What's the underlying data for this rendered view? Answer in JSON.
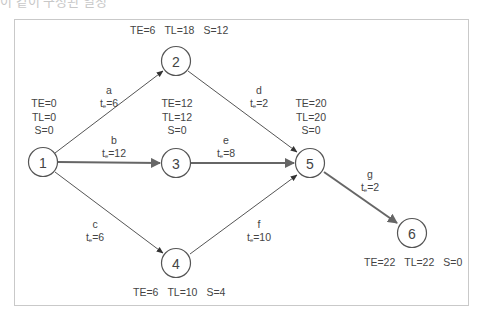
{
  "cutoff_text": "이 같이 구성된 일정",
  "colors": {
    "frame": "#c9c9c9",
    "line": "#555555",
    "critical_arrow": "#666666",
    "text": "#444444"
  },
  "nodes": [
    {
      "id": "1",
      "label": "1",
      "cx": 43,
      "cy": 162,
      "TE": "TE=0",
      "TL": "TL=0",
      "S": "S=0"
    },
    {
      "id": "2",
      "label": "2",
      "cx": 176,
      "cy": 61,
      "TE": "TE=6",
      "TL": "TL=18",
      "S": "S=12"
    },
    {
      "id": "3",
      "label": "3",
      "cx": 176,
      "cy": 163,
      "TE": "TE=12",
      "TL": "TL=12",
      "S": "S=0"
    },
    {
      "id": "4",
      "label": "4",
      "cx": 176,
      "cy": 263,
      "TE": "TE=6",
      "TL": "TL=10",
      "S": "S=4"
    },
    {
      "id": "5",
      "label": "5",
      "cx": 310,
      "cy": 163,
      "TE": "TE=20",
      "TL": "TL=20",
      "S": "S=0"
    },
    {
      "id": "6",
      "label": "6",
      "cx": 412,
      "cy": 233,
      "TE": "TE=22",
      "TL": "TL=22",
      "S": "S=0"
    }
  ],
  "edges": [
    {
      "name": "a",
      "from": "1",
      "to": "2",
      "te_prefix": "t",
      "te_sub": "e",
      "te_value": "=6",
      "critical": false
    },
    {
      "name": "b",
      "from": "1",
      "to": "3",
      "te_prefix": "t",
      "te_sub": "e",
      "te_value": "=12",
      "critical": true
    },
    {
      "name": "c",
      "from": "1",
      "to": "4",
      "te_prefix": "t",
      "te_sub": "e",
      "te_value": "=6",
      "critical": false
    },
    {
      "name": "d",
      "from": "2",
      "to": "5",
      "te_prefix": "t",
      "te_sub": "e",
      "te_value": "=2",
      "critical": false
    },
    {
      "name": "e",
      "from": "3",
      "to": "5",
      "te_prefix": "t",
      "te_sub": "e",
      "te_value": "=8",
      "critical": true
    },
    {
      "name": "f",
      "from": "4",
      "to": "5",
      "te_prefix": "t",
      "te_sub": "e",
      "te_value": "=10",
      "critical": false
    },
    {
      "name": "g",
      "from": "5",
      "to": "6",
      "te_prefix": "t",
      "te_sub": "e",
      "te_value": "=2",
      "critical": true
    }
  ]
}
